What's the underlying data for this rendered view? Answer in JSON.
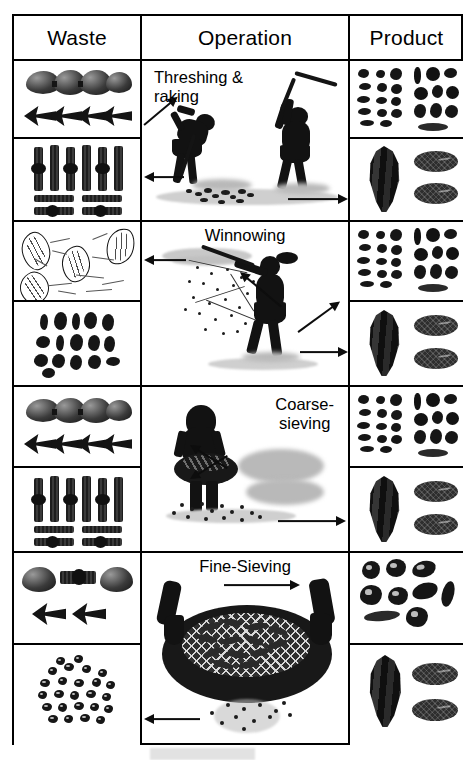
{
  "figure": {
    "type": "crop-processing-flow-table",
    "columns": [
      "Waste",
      "Operation",
      "Product"
    ],
    "background_color": "#ffffff",
    "border_color": "#000000"
  },
  "header": {
    "waste_label": "Waste",
    "operation_label": "Operation",
    "product_label": "Product"
  },
  "rows": [
    {
      "id": "row-threshing-raking",
      "operation_label": "Threshing &\nraking",
      "operation_label_align": "left",
      "waste_cells": [
        {
          "name": "rachis-internodes-specimen",
          "description": "rachis internodes with swollen segments"
        },
        {
          "name": "culm-nodes-specimen",
          "description": "straw culm nodes and internodes"
        }
      ],
      "product_cells": [
        {
          "name": "mixed-seeds-specimen",
          "description": "mixed weed seeds and grains"
        },
        {
          "name": "spikelet-and-grains-specimen",
          "description": "spikelet with two free grains"
        }
      ],
      "arrows": [
        {
          "name": "waste-arrow-diagonal",
          "direction": "up-left"
        },
        {
          "name": "waste-arrow-horizontal",
          "direction": "left"
        },
        {
          "name": "product-arrow-horizontal",
          "direction": "right"
        }
      ]
    },
    {
      "id": "row-winnowing",
      "operation_label": "Winnowing",
      "operation_label_align": "center",
      "waste_cells": [
        {
          "name": "light-chaff-specimen",
          "description": "light chaff, glumes and straw fragments"
        },
        {
          "name": "dark-fragment-specimen",
          "description": "dark glume and awn fragments"
        }
      ],
      "product_cells": [
        {
          "name": "mixed-seeds-specimen",
          "description": "mixed weed seeds and grains"
        },
        {
          "name": "spikelet-and-grains-specimen",
          "description": "spikelet with two free grains"
        }
      ],
      "arrows": [
        {
          "name": "waste-arrow-horizontal",
          "direction": "left"
        },
        {
          "name": "waste-arrow-diagonal",
          "direction": "down-left"
        },
        {
          "name": "product-arrow-diagonal",
          "direction": "up-right"
        },
        {
          "name": "product-arrow-horizontal",
          "direction": "right"
        }
      ]
    },
    {
      "id": "row-coarse-sieving",
      "operation_label": "Coarse-\nsieving",
      "operation_label_align": "right",
      "waste_cells": [
        {
          "name": "rachis-internodes-specimen",
          "description": "rachis internodes with swollen segments"
        },
        {
          "name": "culm-nodes-specimen",
          "description": "straw culm nodes and internodes"
        }
      ],
      "product_cells": [
        {
          "name": "mixed-seeds-specimen",
          "description": "mixed weed seeds and grains"
        },
        {
          "name": "spikelet-and-grains-specimen",
          "description": "spikelet with two free grains"
        }
      ],
      "arrows": [
        {
          "name": "waste-arrow-up-left",
          "direction": "up-left"
        },
        {
          "name": "waste-arrow-down-left",
          "direction": "down-left"
        },
        {
          "name": "product-arrow-horizontal",
          "direction": "right"
        }
      ]
    },
    {
      "id": "row-fine-sieving",
      "operation_label": "Fine-Sieving",
      "operation_label_align": "center",
      "waste_cells": [
        {
          "name": "rachis-fragment-specimen",
          "description": "rachis segments and node fragment"
        },
        {
          "name": "small-weed-seeds-specimen",
          "description": "scatter of small weed seeds"
        }
      ],
      "product_cells": [
        {
          "name": "cleaned-grain-specimen",
          "description": "cleaned grains and seeds"
        },
        {
          "name": "spikelet-and-grains-specimen",
          "description": "spikelet with two free grains"
        }
      ],
      "arrows": [
        {
          "name": "product-arrow-horizontal",
          "direction": "right"
        },
        {
          "name": "waste-arrow-horizontal",
          "direction": "left"
        }
      ]
    }
  ],
  "scenes": [
    {
      "id": "scene-threshing",
      "name": "threshing-and-raking-scene",
      "figures": [
        "raking-person",
        "flailing-person"
      ]
    },
    {
      "id": "scene-winnowing",
      "name": "winnowing-scene",
      "figures": [
        "winnowing-person"
      ]
    },
    {
      "id": "scene-coarse-sieving",
      "name": "coarse-sieving-scene",
      "figures": [
        "sieving-person-with-basket"
      ]
    },
    {
      "id": "scene-fine-sieving",
      "name": "fine-sieving-scene",
      "figures": [
        "hands-holding-sieve"
      ]
    }
  ]
}
